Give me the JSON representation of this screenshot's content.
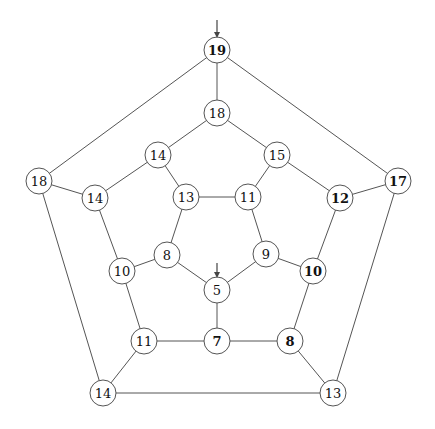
{
  "figure": {
    "title": "",
    "canvas": {
      "width": 435,
      "height": 429,
      "background": "#ffffff"
    },
    "node_radius": 13,
    "colors": {
      "edge": "#555555",
      "node_fill": "#ffffff",
      "node_stroke": "#555555",
      "label": "#111111",
      "arrow": "#444444"
    }
  },
  "chart_data": {
    "type": "diagram",
    "subtype": "node-link-graph",
    "title": "",
    "layout": "three concentric pentagonal rings (dodecahedral graph)",
    "node_count": 20,
    "edge_count": 30,
    "nodes": [
      {
        "id": "n0",
        "label": "19",
        "x": 217,
        "y": 50,
        "bold": true,
        "ring": "outer",
        "ring_index": 0
      },
      {
        "id": "n1",
        "label": "17",
        "x": 398,
        "y": 181,
        "bold": true,
        "ring": "outer",
        "ring_index": 1
      },
      {
        "id": "n2",
        "label": "13",
        "x": 333,
        "y": 393,
        "bold": false,
        "ring": "outer",
        "ring_index": 2
      },
      {
        "id": "n3",
        "label": "14",
        "x": 103,
        "y": 393,
        "bold": false,
        "ring": "outer",
        "ring_index": 3
      },
      {
        "id": "n4",
        "label": "18",
        "x": 39,
        "y": 181,
        "bold": false,
        "ring": "outer",
        "ring_index": 4
      },
      {
        "id": "n5",
        "label": "18",
        "x": 217,
        "y": 113,
        "bold": false,
        "ring": "middle",
        "ring_index": 0
      },
      {
        "id": "n6",
        "label": "15",
        "x": 277,
        "y": 155,
        "bold": false,
        "ring": "middle",
        "ring_index": 1
      },
      {
        "id": "n7",
        "label": "12",
        "x": 340,
        "y": 198,
        "bold": true,
        "ring": "middle",
        "ring_index": 2
      },
      {
        "id": "n8",
        "label": "10",
        "x": 313,
        "y": 271,
        "bold": true,
        "ring": "middle",
        "ring_index": 3
      },
      {
        "id": "n9",
        "label": "8",
        "x": 290,
        "y": 341,
        "bold": true,
        "ring": "middle",
        "ring_index": 4
      },
      {
        "id": "n10",
        "label": "7",
        "x": 217,
        "y": 341,
        "bold": true,
        "ring": "middle",
        "ring_index": 5
      },
      {
        "id": "n11",
        "label": "11",
        "x": 144,
        "y": 341,
        "bold": false,
        "ring": "middle",
        "ring_index": 6
      },
      {
        "id": "n12",
        "label": "10",
        "x": 122,
        "y": 271,
        "bold": false,
        "ring": "middle",
        "ring_index": 7
      },
      {
        "id": "n13",
        "label": "14",
        "x": 95,
        "y": 198,
        "bold": false,
        "ring": "middle",
        "ring_index": 8
      },
      {
        "id": "n14",
        "label": "14",
        "x": 158,
        "y": 155,
        "bold": false,
        "ring": "middle",
        "ring_index": 9
      },
      {
        "id": "n15",
        "label": "13",
        "x": 186,
        "y": 197,
        "bold": false,
        "ring": "inner",
        "ring_index": 0
      },
      {
        "id": "n16",
        "label": "11",
        "x": 248,
        "y": 197,
        "bold": false,
        "ring": "inner",
        "ring_index": 1
      },
      {
        "id": "n17",
        "label": "9",
        "x": 266,
        "y": 254,
        "bold": false,
        "ring": "inner",
        "ring_index": 2
      },
      {
        "id": "n18",
        "label": "5",
        "x": 217,
        "y": 290,
        "bold": false,
        "ring": "inner",
        "ring_index": 3
      },
      {
        "id": "n19",
        "label": "8",
        "x": 167,
        "y": 255,
        "bold": false,
        "ring": "inner",
        "ring_index": 4
      }
    ],
    "edges": [
      {
        "from": "n0",
        "to": "n1"
      },
      {
        "from": "n1",
        "to": "n2"
      },
      {
        "from": "n2",
        "to": "n3"
      },
      {
        "from": "n3",
        "to": "n4"
      },
      {
        "from": "n4",
        "to": "n0"
      },
      {
        "from": "n0",
        "to": "n5"
      },
      {
        "from": "n1",
        "to": "n7"
      },
      {
        "from": "n2",
        "to": "n9"
      },
      {
        "from": "n3",
        "to": "n11"
      },
      {
        "from": "n4",
        "to": "n13"
      },
      {
        "from": "n5",
        "to": "n6"
      },
      {
        "from": "n6",
        "to": "n7"
      },
      {
        "from": "n7",
        "to": "n8"
      },
      {
        "from": "n8",
        "to": "n9"
      },
      {
        "from": "n9",
        "to": "n10"
      },
      {
        "from": "n10",
        "to": "n11"
      },
      {
        "from": "n11",
        "to": "n12"
      },
      {
        "from": "n12",
        "to": "n13"
      },
      {
        "from": "n13",
        "to": "n14"
      },
      {
        "from": "n14",
        "to": "n5"
      },
      {
        "from": "n6",
        "to": "n16"
      },
      {
        "from": "n8",
        "to": "n17"
      },
      {
        "from": "n10",
        "to": "n18"
      },
      {
        "from": "n12",
        "to": "n19"
      },
      {
        "from": "n14",
        "to": "n15"
      },
      {
        "from": "n15",
        "to": "n16"
      },
      {
        "from": "n16",
        "to": "n17"
      },
      {
        "from": "n17",
        "to": "n18"
      },
      {
        "from": "n18",
        "to": "n19"
      },
      {
        "from": "n19",
        "to": "n15"
      }
    ],
    "arrows": [
      {
        "id": "a0",
        "target": "n0",
        "target_label": "19",
        "x": 217,
        "from_y": 20,
        "to_y": 36
      },
      {
        "id": "a1",
        "target": "n18",
        "target_label": "5",
        "x": 217,
        "from_y": 263,
        "to_y": 276
      }
    ]
  }
}
